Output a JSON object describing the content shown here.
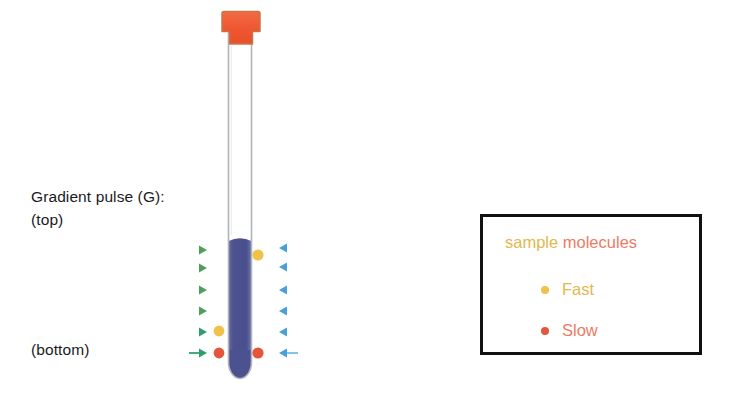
{
  "figure": {
    "title_hidden": "",
    "background_color": "#ffffff"
  },
  "labels": {
    "gradient_pulse": "Gradient pulse (G):",
    "top": "(top)",
    "bottom": "(bottom)"
  },
  "legend": {
    "title_part_sample": "sample",
    "title_part_molecules": " molecules",
    "items": [
      {
        "label": "Fast",
        "dot_color": "#f0c24a",
        "text_color": "#e3b84e"
      },
      {
        "label": "Slow",
        "dot_color": "#e4563b",
        "text_color": "#ec7b63"
      }
    ],
    "border_color": "#111111",
    "background": "#ffffff"
  },
  "tube": {
    "cap_color": "#f05a36",
    "cap_stroke": "#c96a44",
    "wall_color": "#b4b7bb",
    "liquid_color": "#4f5494",
    "glass_color": "#ffffff",
    "cap_top_y": 12,
    "cap_bottom_y": 45,
    "liquid_surface_y": 238,
    "tube_bottom_y": 378,
    "tube_left_x": 228,
    "tube_right_x": 251
  },
  "arrows": {
    "left_green": {
      "color_start": "#7fc5c0",
      "color_end": "#4f9e5c",
      "head_x": 206,
      "items": [
        {
          "y": 250,
          "x_start": 71
        },
        {
          "y": 268,
          "x_start": 97
        },
        {
          "y": 290,
          "x_start": 131
        },
        {
          "y": 311,
          "x_start": 152
        },
        {
          "y": 332,
          "x_start": 171
        },
        {
          "y": 353,
          "x_start": 189
        }
      ]
    },
    "right_blue": {
      "color_start": "#4a9fd8",
      "color_end": "#b8dcf2",
      "head_x": 280,
      "items": [
        {
          "y": 248,
          "x_end": 413
        },
        {
          "y": 267,
          "x_end": 389
        },
        {
          "y": 290,
          "x_end": 358
        },
        {
          "y": 311,
          "x_end": 339
        },
        {
          "y": 332,
          "x_end": 321
        },
        {
          "y": 353,
          "x_end": 298
        }
      ]
    }
  },
  "molecules": [
    {
      "id": "fast-top-right",
      "x": 258,
      "y": 255,
      "r": 5.5,
      "color": "#f0c24a",
      "type": "Fast"
    },
    {
      "id": "fast-bottom-left",
      "x": 219,
      "y": 331,
      "r": 5.5,
      "color": "#f0c24a",
      "type": "Fast"
    },
    {
      "id": "slow-bottom-left",
      "x": 219,
      "y": 353,
      "r": 5.5,
      "color": "#e4563b",
      "type": "Slow"
    },
    {
      "id": "slow-bottom-right",
      "x": 258,
      "y": 353,
      "r": 5.5,
      "color": "#e4563b",
      "type": "Slow"
    }
  ]
}
